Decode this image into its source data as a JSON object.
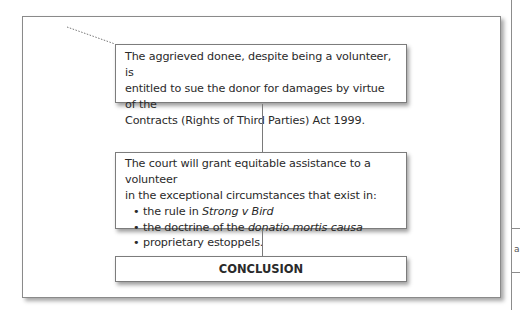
{
  "diagram": {
    "type": "flowchart",
    "nodes": [
      {
        "id": "node-1",
        "text": "The aggrieved donee, despite being a volunteer, is entitled to sue the donor for damages by virtue of the Contracts (Rights of Third Parties) Act 1999.",
        "lines": [
          "The aggrieved donee, despite being a volunteer, is",
          "entitled to sue the donor for damages by virtue of the",
          "Contracts (Rights of Third Parties) Act 1999."
        ]
      },
      {
        "id": "node-2",
        "intro_lines": [
          "The court will grant equitable assistance to a volunteer",
          "in the exceptional circumstances that exist in:"
        ],
        "bullets": [
          {
            "prefix": "the rule in ",
            "italic": "Strong v Bird",
            "suffix": ""
          },
          {
            "prefix": "the doctrine of the ",
            "italic": "donatio mortis causa",
            "suffix": ""
          },
          {
            "prefix": "proprietary estoppels.",
            "italic": "",
            "suffix": ""
          }
        ],
        "bullet_glyph": "•"
      },
      {
        "id": "node-3",
        "text": "CONCLUSION"
      }
    ],
    "edges": [
      {
        "from": "node-1",
        "to": "node-2"
      },
      {
        "from": "node-2",
        "to": "node-3"
      }
    ],
    "leader_line": {
      "style": "dotted",
      "points_to": "node-1"
    }
  },
  "adjacent_page": {
    "glyph": "a"
  },
  "colors": {
    "border": "#7c7c7c",
    "text": "#2a2a2a",
    "background": "#ffffff"
  }
}
